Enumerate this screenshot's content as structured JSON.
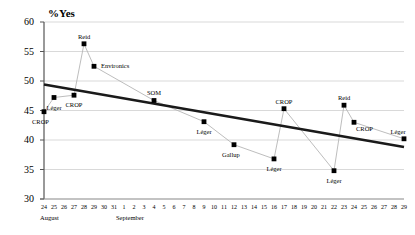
{
  "axis_title": "%Yes",
  "y_ticks": [
    60,
    55,
    50,
    45,
    40,
    35,
    30
  ],
  "x_ticks": [
    "24",
    "25",
    "26",
    "27",
    "28",
    "29",
    "30",
    "31",
    "1",
    "2",
    "3",
    "4",
    "5",
    "6",
    "7",
    "8",
    "9",
    "10",
    "11",
    "12",
    "13",
    "14",
    "15",
    "16",
    "17",
    "18",
    "19",
    "20",
    "21",
    "22",
    "23",
    "24",
    "25",
    "26",
    "27",
    "28",
    "29"
  ],
  "month_labels": [
    {
      "name": "August"
    },
    {
      "name": "September"
    }
  ],
  "colors": {
    "marker": "#000000",
    "connector": "#b5b5b5",
    "trend": "#1a1a1a",
    "gridline": "#c8c8c8",
    "axis": "#808080"
  },
  "chart_data": {
    "type": "scatter",
    "title": "",
    "xlabel": "",
    "ylabel": "%Yes",
    "ylim": [
      30,
      60
    ],
    "grid": true,
    "legend": "none",
    "categories": [
      "Aug 24",
      "Aug 25",
      "Aug 27",
      "Aug 28",
      "Aug 29",
      "Sep 4",
      "Sep 9",
      "Sep 12",
      "Sep 16",
      "Sep 17",
      "Sep 22",
      "Sep 23",
      "Sep 24",
      "Sep 29"
    ],
    "points": [
      {
        "label": "CROP",
        "x_tick": "24",
        "month": "August",
        "value": 44.8,
        "label_pos": "below-left"
      },
      {
        "label": "Léger",
        "x_tick": "25",
        "month": "August",
        "value": 47.2,
        "label_pos": "below"
      },
      {
        "label": "CROP",
        "x_tick": "27",
        "month": "August",
        "value": 47.6,
        "label_pos": "below"
      },
      {
        "label": "Reid",
        "x_tick": "28",
        "month": "August",
        "value": 56.3,
        "label_pos": "above"
      },
      {
        "label": "Environics",
        "x_tick": "29",
        "month": "August",
        "value": 52.5,
        "label_pos": "right"
      },
      {
        "label": "SOM",
        "x_tick": "4",
        "month": "September",
        "value": 46.7,
        "label_pos": "above"
      },
      {
        "label": "Léger",
        "x_tick": "9",
        "month": "September",
        "value": 43.1,
        "label_pos": "below"
      },
      {
        "label": "Gallup",
        "x_tick": "12",
        "month": "September",
        "value": 39.2,
        "label_pos": "below-left"
      },
      {
        "label": "Léger",
        "x_tick": "16",
        "month": "September",
        "value": 36.8,
        "label_pos": "below"
      },
      {
        "label": "CROP",
        "x_tick": "17",
        "month": "September",
        "value": 45.3,
        "label_pos": "above"
      },
      {
        "label": "Léger",
        "x_tick": "22",
        "month": "September",
        "value": 34.8,
        "label_pos": "below"
      },
      {
        "label": "Reid",
        "x_tick": "23",
        "month": "September",
        "value": 45.9,
        "label_pos": "above"
      },
      {
        "label": "CROP",
        "x_tick": "24",
        "month": "September",
        "value": 43.0,
        "label_pos": "below-right"
      },
      {
        "label": "Léger",
        "x_tick": "29",
        "month": "September",
        "value": 40.2,
        "label_pos": "above-left"
      }
    ],
    "trendline": {
      "start_value": 49.4,
      "end_value": 38.8
    }
  }
}
